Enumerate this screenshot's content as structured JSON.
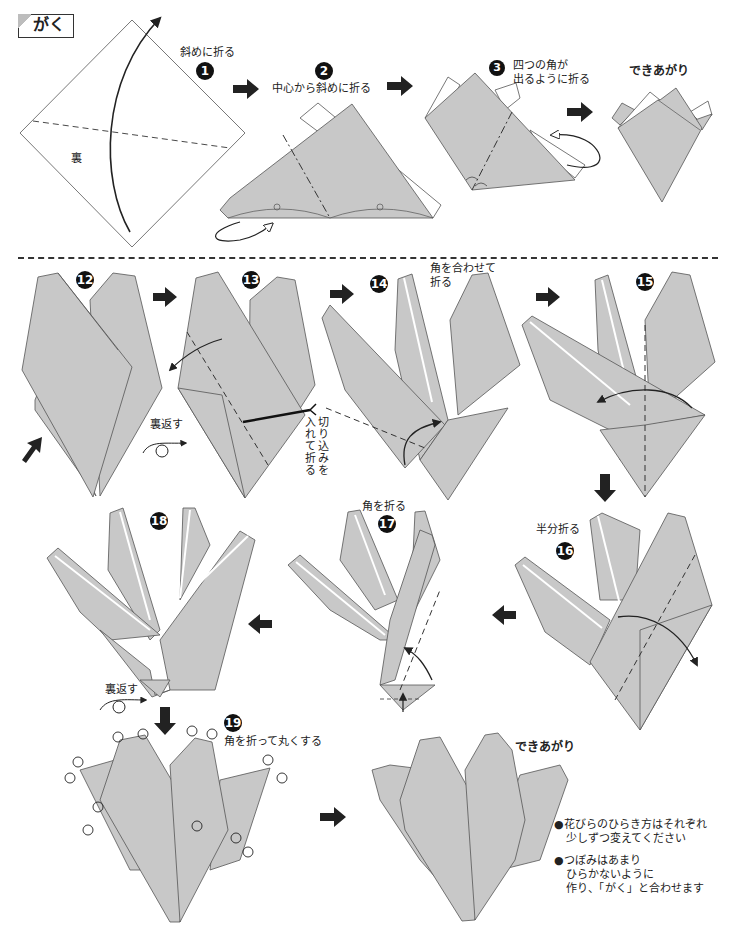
{
  "title": "がく",
  "colors": {
    "paper_gray": "#c8c8c8",
    "paper_white": "#ffffff",
    "line": "#333333",
    "arrow": "#222222"
  },
  "top_section": {
    "steps": [
      {
        "number": "1",
        "instruction": "斜めに折る",
        "back_label": "裏"
      },
      {
        "number": "2",
        "instruction": "中心から斜めに折る"
      },
      {
        "number": "3",
        "instruction_line1": "四つの角が",
        "instruction_line2": "出るように折る"
      },
      {
        "number": "",
        "instruction": "できあがり"
      }
    ]
  },
  "bottom_section": {
    "steps": [
      {
        "number": "12",
        "instruction": ""
      },
      {
        "number": "13",
        "instruction_vertical_1": "切り込みを",
        "instruction_vertical_2": "入れて折る",
        "flip_label": "裏返す"
      },
      {
        "number": "14",
        "instruction_line1": "角を合わせて",
        "instruction_line2": "折る"
      },
      {
        "number": "15",
        "instruction": ""
      },
      {
        "number": "16",
        "instruction": "半分折る"
      },
      {
        "number": "17",
        "instruction": "角を折る"
      },
      {
        "number": "18",
        "instruction": "",
        "flip_label": "裏返す"
      },
      {
        "number": "19",
        "instruction": "角を折って丸くする"
      },
      {
        "number": "",
        "instruction": "できあがり"
      }
    ],
    "notes": [
      {
        "line1": "●花びらのひらき方はそれぞれ",
        "line2": "少しずつ変えてください"
      },
      {
        "line1": "●つぼみはあまり",
        "line2": "ひらかないように",
        "line3": "作り、「がく」と合わせます"
      }
    ]
  }
}
